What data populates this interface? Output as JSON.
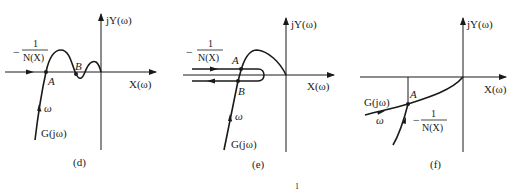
{
  "figure": {
    "panels": [
      {
        "id": "d",
        "caption": "(d)",
        "y_axis_label": "jY(ω)",
        "x_axis_label": "X(ω)",
        "curve_label": "G(jω)",
        "omega_label": "ω",
        "describing_label_minus": "−",
        "describing_label_num": "1",
        "describing_label_den": "N(X)",
        "points": [
          "A",
          "B"
        ]
      },
      {
        "id": "e",
        "caption": "(e)",
        "y_axis_label": "jY(ω)",
        "x_axis_label": "X(ω)",
        "curve_label": "G(jω)",
        "omega_label": "ω",
        "describing_label_minus": "−",
        "describing_label_num": "1",
        "describing_label_den": "N(X)",
        "points": [
          "A",
          "B"
        ]
      },
      {
        "id": "f",
        "caption": "(f)",
        "y_axis_label": "jY(ω)",
        "x_axis_label": "X(ω)",
        "curve_label": "G(jω)",
        "omega_label": "ω",
        "describing_label_minus": "−",
        "describing_label_num": "1",
        "describing_label_den": "N(X)",
        "points": [
          "A"
        ]
      }
    ],
    "page_number_fragment": "1"
  }
}
